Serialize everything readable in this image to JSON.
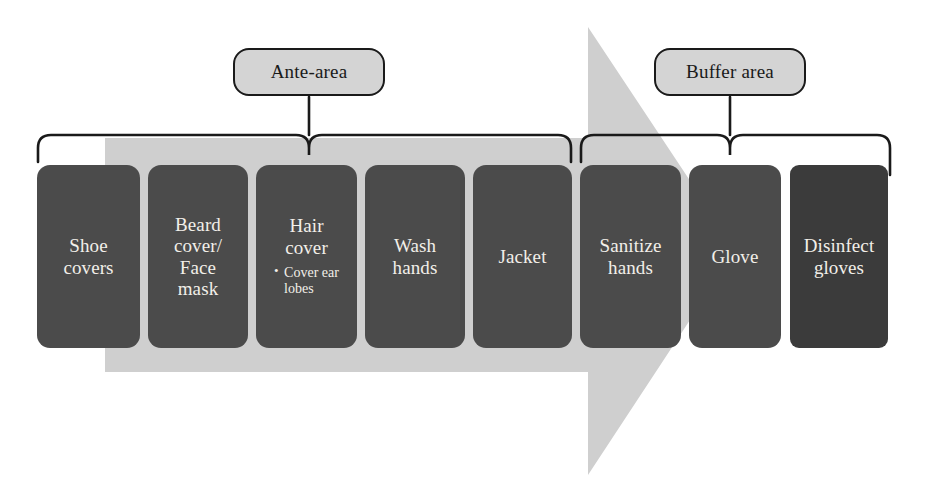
{
  "diagram": {
    "colors": {
      "arrow_fill": "#cfcfcf",
      "box_fill": "#4b4b4b",
      "box_fill_dark": "#3b3b3b",
      "box_text": "#f2efe9",
      "callout_fill": "#d4d4d4",
      "callout_border": "#1a1a1a",
      "brace_stroke": "#1a1a1a",
      "background": "#ffffff"
    },
    "callouts": [
      {
        "id": "ante",
        "label": "Ante-area"
      },
      {
        "id": "buffer",
        "label": "Buffer area"
      }
    ],
    "steps": [
      {
        "index": 1,
        "label": "Shoe\ncovers",
        "note": "",
        "x": 37,
        "width": 103,
        "dark": false
      },
      {
        "index": 2,
        "label": "Beard\ncover/\nFace\nmask",
        "note": "",
        "x": 148,
        "width": 100,
        "dark": false
      },
      {
        "index": 3,
        "label": "Hair\ncover",
        "note": "Cover ear\nlobes",
        "x": 256,
        "width": 101,
        "dark": false
      },
      {
        "index": 4,
        "label": "Wash\nhands",
        "note": "",
        "x": 365,
        "width": 100,
        "dark": false
      },
      {
        "index": 5,
        "label": "Jacket",
        "note": "",
        "x": 473,
        "width": 99,
        "dark": false
      },
      {
        "index": 6,
        "label": "Sanitize\nhands",
        "note": "",
        "x": 580,
        "width": 101,
        "dark": false
      },
      {
        "index": 7,
        "label": "Glove",
        "note": "",
        "x": 689,
        "width": 92,
        "dark": false
      },
      {
        "index": 8,
        "label": "Disinfect\ngloves",
        "note": "",
        "x": 790,
        "width": 98,
        "dark": true
      }
    ]
  }
}
